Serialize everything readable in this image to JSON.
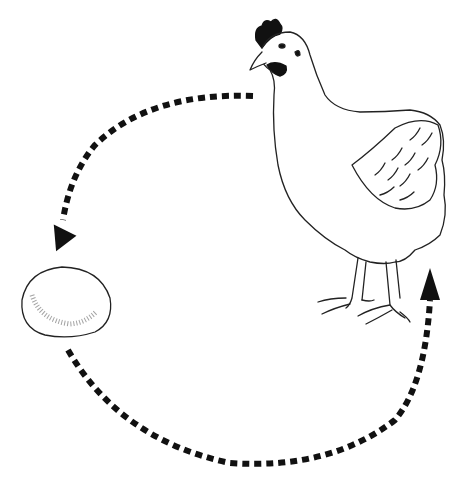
{
  "diagram": {
    "type": "life-cycle",
    "nodes": [
      {
        "id": "hen",
        "label": "hen",
        "icon": "hen-icon"
      },
      {
        "id": "egg",
        "label": "egg",
        "icon": "egg-icon"
      }
    ],
    "edges": [
      {
        "from": "hen",
        "to": "egg",
        "style": "dashed-arrow",
        "path": "upper-left arc"
      },
      {
        "from": "egg",
        "to": "hen",
        "style": "dashed-arrow",
        "path": "lower arc"
      }
    ],
    "colors": {
      "ink": "#111111",
      "background": "#ffffff"
    }
  }
}
